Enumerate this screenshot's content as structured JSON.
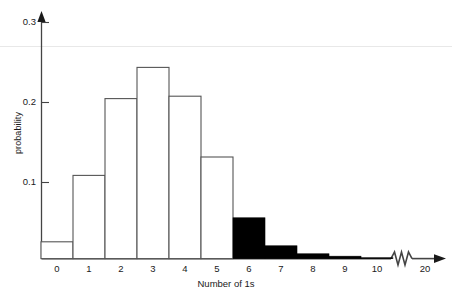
{
  "chart_data": {
    "type": "bar",
    "title": "",
    "subtitle": "",
    "xlabel": "Number of 1s",
    "ylabel": "probability",
    "categories": [
      "0",
      "1",
      "2",
      "3",
      "4",
      "5",
      "6",
      "7",
      "8",
      "9",
      "10",
      "20"
    ],
    "values": [
      0.021,
      0.104,
      0.2,
      0.239,
      0.203,
      0.127,
      0.051,
      0.016,
      0.006,
      0.003,
      0.001,
      0.0
    ],
    "series": [
      {
        "name": "probability",
        "values": [
          0.021,
          0.104,
          0.2,
          0.239,
          0.203,
          0.127,
          0.051,
          0.016,
          0.006,
          0.003,
          0.001,
          0.0
        ]
      }
    ],
    "bar_styles": [
      "open",
      "open",
      "open",
      "open",
      "open",
      "open",
      "filled",
      "filled",
      "filled",
      "filled",
      "filled",
      "none"
    ],
    "ylim": [
      0.0,
      0.31
    ],
    "yticks": [
      0.1,
      0.2,
      0.3
    ],
    "ytick_labels": [
      "0.1",
      "0.2",
      "0.3"
    ],
    "xtick_labels": [
      "0",
      "1",
      "2",
      "3",
      "4",
      "5",
      "6",
      "7",
      "8",
      "9",
      "10",
      "20"
    ],
    "grid": false,
    "legend": false,
    "legend_position": "none",
    "axis_break": true,
    "axis_break_note": "zigzag break on x-axis between 10 and 20",
    "y_axis_arrow": true,
    "x_axis_arrow": true,
    "open_bar_color": "#ffffff",
    "open_bar_edge_color": "#555555",
    "filled_bar_color": "#000000",
    "axis_color": "#444444"
  },
  "axes": {
    "y_label_text": "probability",
    "x_label_text": "Number of 1s",
    "y_tick_0": "0.1",
    "y_tick_1": "0.2",
    "y_tick_2": "0.3"
  },
  "x_ticks": {
    "t0": "0",
    "t1": "1",
    "t2": "2",
    "t3": "3",
    "t4": "4",
    "t5": "5",
    "t6": "6",
    "t7": "7",
    "t8": "8",
    "t9": "9",
    "t10": "10",
    "t11": "20"
  }
}
